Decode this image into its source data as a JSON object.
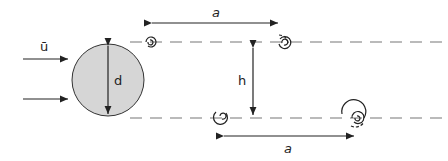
{
  "diagram": {
    "labels": {
      "velocity": "ū",
      "diameter": "d",
      "spacing_top": "a",
      "spacing_bottom": "a",
      "height": "h"
    },
    "colors": {
      "cylinder_fill": "#d6d6d6",
      "stroke": "#222222",
      "dash": "#777777"
    }
  }
}
